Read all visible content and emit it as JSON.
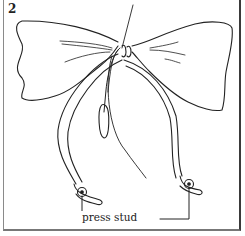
{
  "figure": {
    "step_number": "2",
    "label": "press stud",
    "line_color": "#222222",
    "background": "#ffffff"
  }
}
